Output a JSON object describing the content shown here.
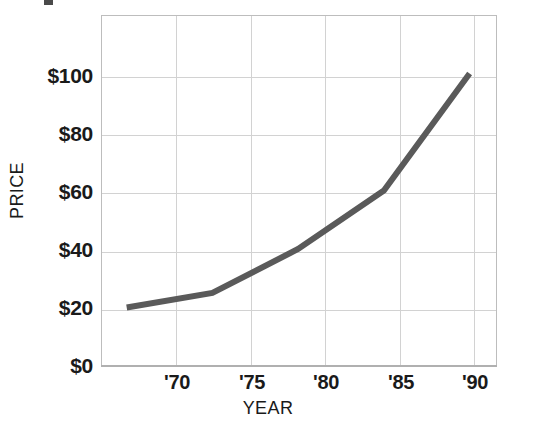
{
  "chart_data": {
    "type": "line",
    "title": "",
    "xlabel": "YEAR",
    "ylabel": "PRICE",
    "categories": [
      "'70",
      "'75",
      "'80",
      "'85",
      "'90"
    ],
    "x": [
      1970,
      1975,
      1980,
      1985,
      1990
    ],
    "values": [
      20,
      25,
      40,
      60,
      100
    ],
    "series": [
      {
        "name": "Price",
        "values": [
          20,
          25,
          40,
          60,
          100
        ],
        "color": "#5a5a5a"
      }
    ],
    "ylim": [
      0,
      120
    ],
    "xlim": [
      1968.5,
      1991.6
    ],
    "ytick_labels": [
      "$0",
      "$20",
      "$40",
      "$60",
      "$80",
      "$100"
    ],
    "ytick_values": [
      0,
      20,
      40,
      60,
      80,
      100
    ],
    "xtick_labels": [
      "'70",
      "'75",
      "'80",
      "'85",
      "'90"
    ],
    "grid": true,
    "grid_color": "#d2d2d2",
    "legend": false,
    "legend_position": "none",
    "line_color": "#5a5a5a",
    "line_width": 6,
    "plot_border_color": "#bdbdbd",
    "background_color": "#ffffff",
    "text_color": "#1a1a1a",
    "annotations": []
  },
  "axes": {
    "y": {
      "title": "PRICE",
      "ticks": [
        {
          "label": "$100",
          "value": 100
        },
        {
          "label": "$80",
          "value": 80
        },
        {
          "label": "$60",
          "value": 60
        },
        {
          "label": "$40",
          "value": 40
        },
        {
          "label": "$20",
          "value": 20
        },
        {
          "label": "$0",
          "value": 0
        }
      ]
    },
    "x": {
      "title": "YEAR",
      "ticks": [
        {
          "label": "'70",
          "value": 1970
        },
        {
          "label": "'75",
          "value": 1975
        },
        {
          "label": "'80",
          "value": 1980
        },
        {
          "label": "'85",
          "value": 1985
        },
        {
          "label": "'90",
          "value": 1990
        }
      ]
    }
  }
}
